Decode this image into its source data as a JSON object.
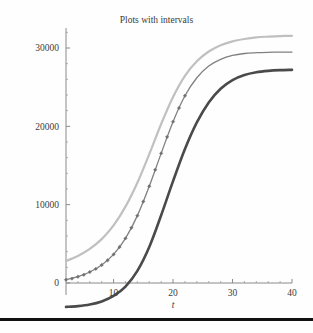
{
  "figure": {
    "title": "Plots with intervals",
    "x_axis_title": "t",
    "y_axis_title": ""
  },
  "axes": {
    "x_ticks": [
      "10",
      "20",
      "30",
      "40"
    ],
    "y_ticks": [
      "0",
      "10000",
      "20000",
      "30000"
    ]
  },
  "colors": {
    "upper_curve": "#c0c0c0",
    "middle_curve": "#808080",
    "lower_curve": "#4a4a4a",
    "axis": "#8a8a8a",
    "text": "#3c3c3c",
    "rule": "#111111"
  },
  "chart_data": {
    "type": "line",
    "title": "Plots with intervals",
    "xlabel": "t",
    "ylabel": "",
    "xlim": [
      2,
      40
    ],
    "ylim": [
      -3400,
      32200
    ],
    "grid": false,
    "legend": "none",
    "x_ticks": [
      10,
      20,
      30,
      40
    ],
    "y_ticks": [
      0,
      10000,
      20000,
      30000
    ],
    "x_minor_ticks": [
      4,
      6,
      8,
      12,
      14,
      16,
      18,
      22,
      24,
      26,
      28,
      32,
      34,
      36,
      38
    ],
    "y_minor_ticks": [
      2000,
      4000,
      6000,
      8000,
      12000,
      14000,
      16000,
      18000,
      22000,
      24000,
      26000,
      28000,
      32000
    ],
    "x": [
      2,
      4,
      6,
      8,
      10,
      12,
      14,
      16,
      18,
      20,
      22,
      24,
      26,
      28,
      30,
      32,
      34,
      36,
      38,
      40
    ],
    "series": [
      {
        "name": "upper interval",
        "style": "solid",
        "color": "#c0c0c0",
        "width": 2.2,
        "markers": false,
        "values": [
          2800,
          3450,
          4350,
          5600,
          7350,
          9750,
          12800,
          16450,
          20300,
          23750,
          26450,
          28300,
          29550,
          30350,
          30850,
          31150,
          31350,
          31450,
          31520,
          31560
        ]
      },
      {
        "name": "fitted curve with data points",
        "style": "solid",
        "color": "#808080",
        "width": 1.3,
        "markers": true,
        "marker_shape": "diamond",
        "values": [
          420,
          800,
          1400,
          2300,
          3650,
          5700,
          8600,
          12350,
          16550,
          20600,
          23900,
          26200,
          27700,
          28550,
          29050,
          29300,
          29400,
          29450,
          29470,
          29480
        ]
      },
      {
        "name": "lower interval",
        "style": "solid",
        "color": "#4a4a4a",
        "width": 2.6,
        "markers": false,
        "values": [
          -3050,
          -2950,
          -2750,
          -2350,
          -1650,
          -450,
          1550,
          4600,
          8650,
          13000,
          17100,
          20500,
          23050,
          24800,
          25900,
          26550,
          26900,
          27080,
          27170,
          27210
        ]
      }
    ],
    "data_points": {
      "name": "observed data",
      "marker_shape": "diamond",
      "color": "#707070",
      "x": [
        2,
        3,
        4,
        5,
        6,
        7,
        8,
        9,
        10,
        11,
        12,
        13,
        14,
        15,
        16,
        17,
        18,
        19,
        20,
        21,
        22
      ],
      "y": [
        420,
        560,
        800,
        1050,
        1400,
        1800,
        2300,
        2900,
        3650,
        4600,
        5700,
        7050,
        8600,
        10400,
        12350,
        14450,
        16550,
        18650,
        20600,
        22350,
        23900
      ]
    }
  }
}
